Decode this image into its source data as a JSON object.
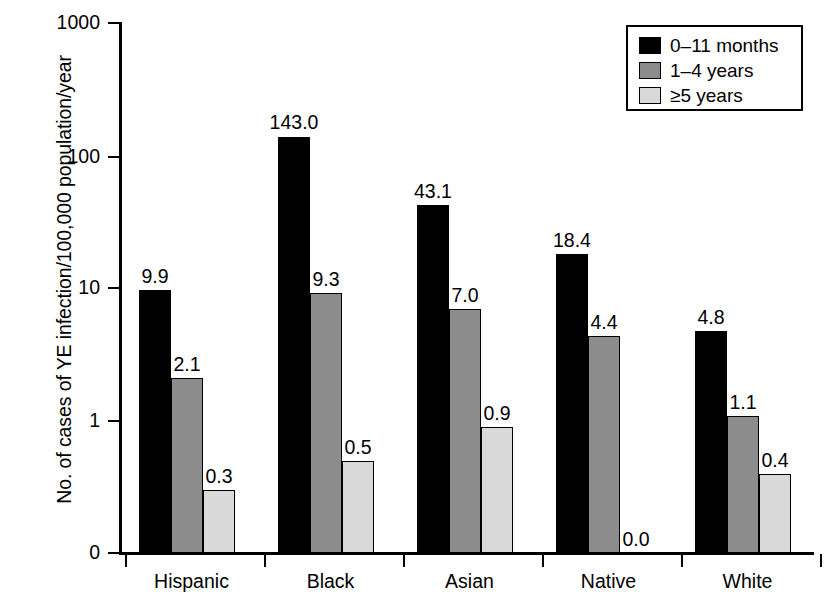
{
  "chart_data": {
    "type": "bar",
    "title": "",
    "subtitle": "",
    "xlabel": "",
    "ylabel": "No. of cases of YE infection/100,000 population/year",
    "categories": [
      "Hispanic",
      "Black",
      "Asian",
      "Native",
      "White"
    ],
    "series": [
      {
        "name": "0–11 months",
        "color": "#000000",
        "values": [
          9.9,
          143.0,
          43.1,
          18.4,
          4.8
        ],
        "labels": [
          "9.9",
          "143.0",
          "43.1",
          "18.4",
          "4.8"
        ]
      },
      {
        "name": "1–4 years",
        "color": "#8c8c8c",
        "values": [
          2.1,
          9.3,
          7.0,
          4.4,
          1.1
        ],
        "labels": [
          "2.1",
          "9.3",
          "7.0",
          "4.4",
          "1.1"
        ]
      },
      {
        "name": "≥5 years",
        "color": "#d9d9d9",
        "values": [
          0.3,
          0.5,
          0.9,
          0.0,
          0.4
        ],
        "labels": [
          "0.3",
          "0.5",
          "0.9",
          "0.0",
          "0.4"
        ]
      }
    ],
    "yscale": "log",
    "ytick_labels": [
      "1000",
      "100",
      "10",
      "1",
      "0"
    ],
    "ytick_values": [
      1000,
      100,
      10,
      1,
      0
    ],
    "ylim": [
      0,
      1000
    ],
    "grid": false,
    "legend_position": "top-right",
    "legend_entries": [
      "0–11 months",
      "1–4 years",
      "≥5 years"
    ]
  },
  "legend": {
    "items": [
      {
        "label": "0–11 months",
        "swatch": "black-swatch"
      },
      {
        "label": "1–4 years",
        "swatch": "dark-gray-swatch"
      },
      {
        "label": "≥5 years",
        "swatch": "light-gray-swatch"
      }
    ]
  }
}
